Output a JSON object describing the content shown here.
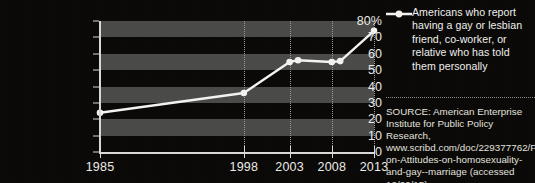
{
  "chart_data": {
    "type": "line",
    "title": "",
    "xlabel": "",
    "ylabel": "",
    "ylim": [
      0,
      80
    ],
    "ytick_labels": [
      "80%",
      "70",
      "60",
      "50",
      "40",
      "30",
      "20",
      "10",
      "0"
    ],
    "ytick_values": [
      80,
      70,
      60,
      50,
      40,
      30,
      20,
      10,
      0
    ],
    "xtick_labels": [
      "1985",
      "1998",
      "2003",
      "2008",
      "2013"
    ],
    "xtick_values": [
      1985,
      1998,
      2003,
      2008,
      2013
    ],
    "grid": "horizontal-bands-and-vertical-dotted",
    "legend_position": "right",
    "series": [
      {
        "name": "Americans who report having a gay or lesbian friend, co-worker, or relative who has told them personally",
        "marker": "circle",
        "color": "#f2f2ee",
        "x": [
          1985,
          1998,
          2003,
          2004,
          2008,
          2009,
          2013
        ],
        "values": [
          24,
          36,
          55,
          56,
          55,
          55.5,
          74
        ]
      }
    ]
  },
  "legend": {
    "marker_icon": "line-circle-marker-icon",
    "label": "Americans who report having a gay or lesbian friend, co-worker, or relative who has told them personally"
  },
  "source": {
    "text": "SOURCE: American Enterprise Institute for Public Policy Research, www.scribd.com/doc/229377762/Polls-on-Attitudes-on-homosexuality-and-gay--marriage (accessed 12/29/15)."
  },
  "colors": {
    "background": "#0a0908",
    "band": "#4a4a48",
    "series": "#f2f2ee",
    "axis": "#d8d8d4",
    "text": "#eaeae6"
  }
}
